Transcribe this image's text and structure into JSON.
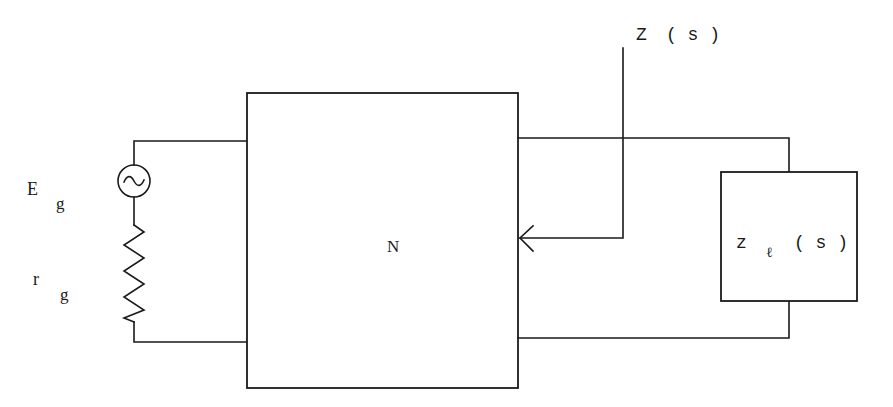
{
  "diagram": {
    "type": "circuit-schematic",
    "colors": {
      "stroke": "#1a1a1a",
      "background": "#ffffff"
    },
    "network": {
      "label": "N"
    },
    "source": {
      "symbol": "~",
      "label_main": "E",
      "label_sub": "g"
    },
    "resistor": {
      "label_main": "r",
      "label_sub": "g"
    },
    "input_impedance": {
      "label_main": "Z",
      "label_arg": "( s )"
    },
    "load": {
      "label_main": "z",
      "label_sub": "ℓ",
      "label_arg": "( s )"
    }
  }
}
